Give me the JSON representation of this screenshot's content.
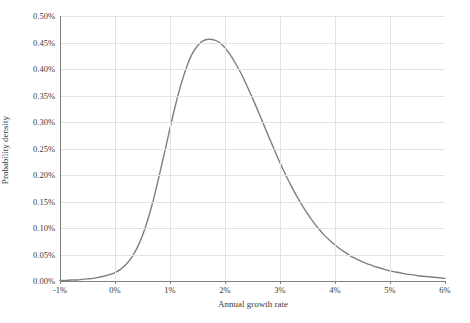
{
  "chart_data": {
    "type": "line",
    "title": "",
    "subtitle": "",
    "xlabel": "Annual growth rate",
    "ylabel": "Probability density",
    "xlim": [
      -1,
      6
    ],
    "ylim": [
      0,
      0.5
    ],
    "grid": true,
    "legend": false,
    "legend_position": "none",
    "x_tick_labels": [
      "-1%",
      "0%",
      "1%",
      "2%",
      "3%",
      "4%",
      "5%",
      "6%"
    ],
    "x_tick_values": [
      -1,
      0,
      1,
      2,
      3,
      4,
      5,
      6
    ],
    "y_tick_labels": [
      "0.00%",
      "0.05%",
      "0.10%",
      "0.15%",
      "0.20%",
      "0.25%",
      "0.30%",
      "0.35%",
      "0.40%",
      "0.45%",
      "0.50%"
    ],
    "y_tick_values": [
      0,
      0.05,
      0.1,
      0.15,
      0.2,
      0.25,
      0.3,
      0.35,
      0.4,
      0.45,
      0.5
    ],
    "series": [
      {
        "name": "Probability density",
        "color": "#7f7f7f",
        "x": [
          -1.0,
          -0.9,
          -0.8,
          -0.7,
          -0.6,
          -0.5,
          -0.4,
          -0.3,
          -0.2,
          -0.1,
          0.0,
          0.1,
          0.2,
          0.3,
          0.4,
          0.5,
          0.6,
          0.7,
          0.8,
          0.9,
          1.0,
          1.1,
          1.2,
          1.3,
          1.4,
          1.5,
          1.6,
          1.7,
          1.8,
          1.9,
          2.0,
          2.1,
          2.2,
          2.3,
          2.4,
          2.5,
          2.6,
          2.7,
          2.8,
          2.9,
          3.0,
          3.1,
          3.2,
          3.3,
          3.4,
          3.5,
          3.6,
          3.7,
          3.8,
          3.9,
          4.0,
          4.1,
          4.2,
          4.3,
          4.4,
          4.5,
          4.6,
          4.7,
          4.8,
          4.9,
          5.0,
          5.1,
          5.2,
          5.3,
          5.4,
          5.5,
          5.6,
          5.7,
          5.8,
          5.9,
          6.0
        ],
        "y": [
          0.001,
          0.001,
          0.002,
          0.002,
          0.003,
          0.004,
          0.005,
          0.007,
          0.009,
          0.012,
          0.016,
          0.022,
          0.031,
          0.044,
          0.062,
          0.086,
          0.117,
          0.154,
          0.197,
          0.242,
          0.288,
          0.332,
          0.371,
          0.403,
          0.428,
          0.444,
          0.453,
          0.456,
          0.455,
          0.45,
          0.44,
          0.426,
          0.409,
          0.39,
          0.368,
          0.345,
          0.321,
          0.296,
          0.271,
          0.247,
          0.223,
          0.201,
          0.18,
          0.161,
          0.143,
          0.127,
          0.112,
          0.099,
          0.087,
          0.077,
          0.068,
          0.06,
          0.053,
          0.046,
          0.041,
          0.036,
          0.032,
          0.028,
          0.025,
          0.022,
          0.019,
          0.017,
          0.015,
          0.013,
          0.012,
          0.01,
          0.009,
          0.008,
          0.007,
          0.006,
          0.005
        ],
        "peak_x": 1.85,
        "peak_y": 0.455
      }
    ],
    "annotations": []
  },
  "style": {
    "axis_color": "#808080",
    "grid_color": "#e2e2e2",
    "text_color": "#3b3b3b",
    "background": "#ffffff",
    "curve_color": "#7f7f7f"
  }
}
